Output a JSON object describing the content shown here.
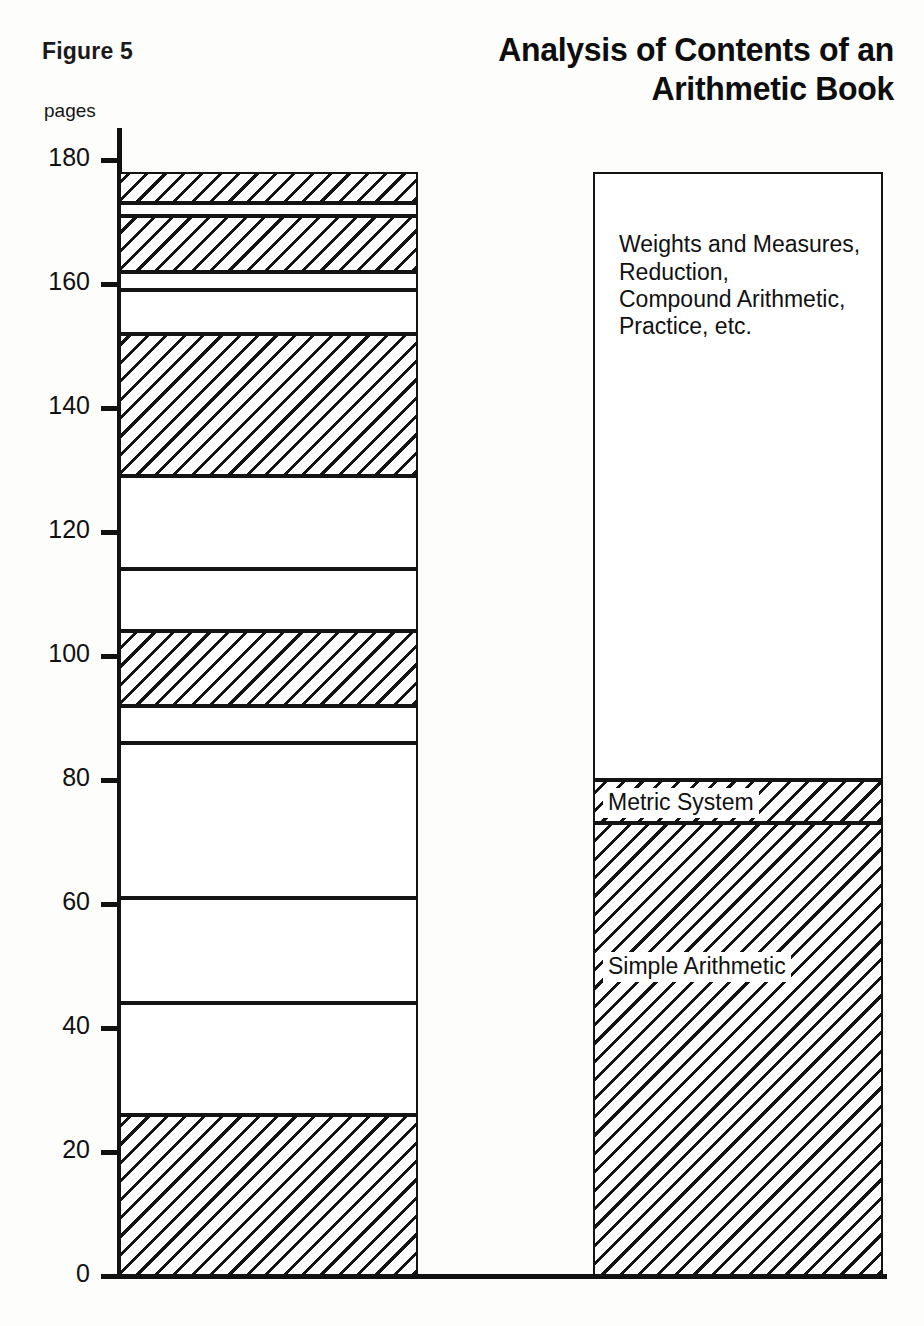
{
  "figure": {
    "label": "Figure 5"
  },
  "header": {
    "title_line1": "Analysis of Contents of an",
    "title_line2": "Arithmetic Book"
  },
  "axis": {
    "y_unit": "pages",
    "y_ticks": [
      "180",
      "160",
      "140",
      "120",
      "100",
      "80",
      "60",
      "40",
      "20",
      "0"
    ]
  },
  "labels": {
    "weights_measures": "Weights and Measures,\nReduction,\nCompound Arithmetic,\nPractice, etc.",
    "metric_system": "Metric System",
    "simple_arithmetic": "Simple Arithmetic"
  },
  "chart_data": {
    "type": "bar",
    "title": "Analysis of Contents of an Arithmetic Book",
    "xlabel": "",
    "ylabel": "pages",
    "ylim": [
      0,
      180
    ],
    "yticks": [
      0,
      20,
      40,
      60,
      80,
      100,
      120,
      140,
      160,
      180
    ],
    "grid": false,
    "legend": "none",
    "categories": [
      "Detailed page blocks",
      "Grouped subject areas"
    ],
    "series": [
      {
        "name": "Detailed page blocks",
        "bar": "left",
        "total": 178,
        "segments": [
          {
            "from": 173,
            "to": 178,
            "pages": 5,
            "fill": "hatched"
          },
          {
            "from": 171,
            "to": 173,
            "pages": 2,
            "fill": "blank"
          },
          {
            "from": 162,
            "to": 171,
            "pages": 9,
            "fill": "hatched"
          },
          {
            "from": 159,
            "to": 162,
            "pages": 3,
            "fill": "blank"
          },
          {
            "from": 152,
            "to": 159,
            "pages": 7,
            "fill": "blank"
          },
          {
            "from": 129,
            "to": 152,
            "pages": 23,
            "fill": "hatched"
          },
          {
            "from": 114,
            "to": 129,
            "pages": 15,
            "fill": "blank"
          },
          {
            "from": 104,
            "to": 114,
            "pages": 10,
            "fill": "blank"
          },
          {
            "from": 92,
            "to": 104,
            "pages": 12,
            "fill": "hatched"
          },
          {
            "from": 86,
            "to": 92,
            "pages": 6,
            "fill": "blank"
          },
          {
            "from": 61,
            "to": 86,
            "pages": 25,
            "fill": "blank"
          },
          {
            "from": 44,
            "to": 61,
            "pages": 17,
            "fill": "blank"
          },
          {
            "from": 26,
            "to": 44,
            "pages": 18,
            "fill": "blank"
          },
          {
            "from": 0,
            "to": 26,
            "pages": 26,
            "fill": "hatched"
          }
        ]
      },
      {
        "name": "Grouped subject areas",
        "bar": "right",
        "total": 178,
        "segments": [
          {
            "label": "Weights and Measures, Reduction, Compound Arithmetic, Practice, etc.",
            "from": 80,
            "to": 178,
            "pages": 98,
            "fill": "blank"
          },
          {
            "label": "Metric System",
            "from": 73,
            "to": 80,
            "pages": 7,
            "fill": "hatched"
          },
          {
            "label": "Simple Arithmetic",
            "from": 0,
            "to": 73,
            "pages": 73,
            "fill": "hatched"
          }
        ]
      }
    ]
  },
  "colors": {
    "ink": "#141414",
    "paper": "#fdfdfb"
  }
}
